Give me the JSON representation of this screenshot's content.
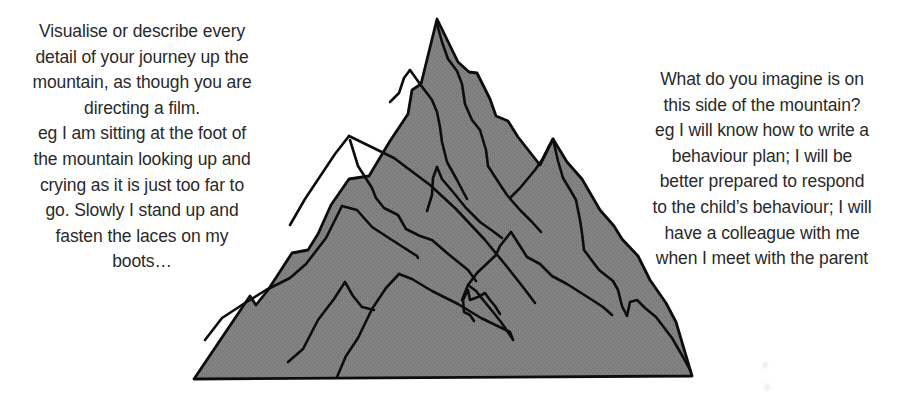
{
  "left_panel": {
    "lines": [
      "Visualise or describe every",
      "detail of your journey up the",
      "mountain, as though you are",
      "directing a film.",
      "eg I am sitting at the foot of",
      "the mountain looking up and",
      "crying as it is just too far to",
      "go. Slowly I stand up and",
      "fasten the laces on my",
      "boots…"
    ]
  },
  "right_panel": {
    "lines": [
      "What do you imagine is on",
      "this side of the mountain?",
      "eg I will know how to write a",
      "behaviour plan; I will be",
      "better prepared to respond",
      "to the child’s behaviour; I will",
      "have a colleague with me",
      "when I meet with the parent"
    ]
  },
  "illustration": {
    "subject": "mountain-icon",
    "fill_color": "#7f7f7f",
    "outline_color": "#0d0d0d"
  }
}
